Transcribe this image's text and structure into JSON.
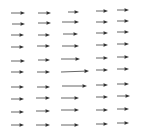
{
  "chart_data": {
    "type": "quiver",
    "title": "",
    "xlabel": "",
    "ylabel": "",
    "grid": false,
    "axes_visible": false,
    "arrow_color": "#333333",
    "columns": 5,
    "rows": 10,
    "arrows": [
      {
        "col": 1,
        "row": 1,
        "x0": 11,
        "y0": 13,
        "x1": 25,
        "y1": 13
      },
      {
        "col": 1,
        "row": 2,
        "x0": 12,
        "y0": 24,
        "x1": 25,
        "y1": 24
      },
      {
        "col": 1,
        "row": 3,
        "x0": 11,
        "y0": 35,
        "x1": 24,
        "y1": 35
      },
      {
        "col": 1,
        "row": 4,
        "x0": 11,
        "y0": 47,
        "x1": 24,
        "y1": 47
      },
      {
        "col": 1,
        "row": 5,
        "x0": 11,
        "y0": 61,
        "x1": 25,
        "y1": 61
      },
      {
        "col": 1,
        "row": 6,
        "x0": 11,
        "y0": 72,
        "x1": 24,
        "y1": 72
      },
      {
        "col": 1,
        "row": 7,
        "x0": 11,
        "y0": 87,
        "x1": 24,
        "y1": 87
      },
      {
        "col": 1,
        "row": 8,
        "x0": 11,
        "y0": 99,
        "x1": 24,
        "y1": 99
      },
      {
        "col": 1,
        "row": 9,
        "x0": 11,
        "y0": 112,
        "x1": 24,
        "y1": 112
      },
      {
        "col": 1,
        "row": 10,
        "x0": 11,
        "y0": 125,
        "x1": 24,
        "y1": 125
      },
      {
        "col": 2,
        "row": 1,
        "x0": 38,
        "y0": 13,
        "x1": 51,
        "y1": 13
      },
      {
        "col": 2,
        "row": 2,
        "x0": 38,
        "y0": 23,
        "x1": 51,
        "y1": 23
      },
      {
        "col": 2,
        "row": 3,
        "x0": 38,
        "y0": 35,
        "x1": 50,
        "y1": 35
      },
      {
        "col": 2,
        "row": 4,
        "x0": 37,
        "y0": 46,
        "x1": 50,
        "y1": 46
      },
      {
        "col": 2,
        "row": 5,
        "x0": 38,
        "y0": 60,
        "x1": 50,
        "y1": 60
      },
      {
        "col": 2,
        "row": 6,
        "x0": 37,
        "y0": 72,
        "x1": 50,
        "y1": 72
      },
      {
        "col": 2,
        "row": 7,
        "x0": 37,
        "y0": 87,
        "x1": 50,
        "y1": 87
      },
      {
        "col": 2,
        "row": 8,
        "x0": 36,
        "y0": 98,
        "x1": 50,
        "y1": 98
      },
      {
        "col": 2,
        "row": 9,
        "x0": 36,
        "y0": 111,
        "x1": 50,
        "y1": 111
      },
      {
        "col": 2,
        "row": 10,
        "x0": 36,
        "y0": 125,
        "x1": 50,
        "y1": 125
      },
      {
        "col": 3,
        "row": 1,
        "x0": 68,
        "y0": 12,
        "x1": 79,
        "y1": 12
      },
      {
        "col": 3,
        "row": 2,
        "x0": 62,
        "y0": 22,
        "x1": 79,
        "y1": 22
      },
      {
        "col": 3,
        "row": 3,
        "x0": 63,
        "y0": 34,
        "x1": 78,
        "y1": 34
      },
      {
        "col": 3,
        "row": 4,
        "x0": 62,
        "y0": 46,
        "x1": 79,
        "y1": 46
      },
      {
        "col": 3,
        "row": 5,
        "x0": 61,
        "y0": 59,
        "x1": 80,
        "y1": 59
      },
      {
        "col": 3,
        "row": 6,
        "x0": 61,
        "y0": 72,
        "x1": 89,
        "y1": 71
      },
      {
        "col": 3,
        "row": 7,
        "x0": 62,
        "y0": 86,
        "x1": 87,
        "y1": 86
      },
      {
        "col": 3,
        "row": 8,
        "x0": 61,
        "y0": 98,
        "x1": 79,
        "y1": 98
      },
      {
        "col": 3,
        "row": 9,
        "x0": 61,
        "y0": 110,
        "x1": 79,
        "y1": 110
      },
      {
        "col": 3,
        "row": 10,
        "x0": 61,
        "y0": 125,
        "x1": 79,
        "y1": 125
      },
      {
        "col": 4,
        "row": 1,
        "x0": 96,
        "y0": 11,
        "x1": 108,
        "y1": 11
      },
      {
        "col": 4,
        "row": 2,
        "x0": 96,
        "y0": 22,
        "x1": 108,
        "y1": 22
      },
      {
        "col": 4,
        "row": 3,
        "x0": 96,
        "y0": 33,
        "x1": 108,
        "y1": 33
      },
      {
        "col": 4,
        "row": 4,
        "x0": 96,
        "y0": 45,
        "x1": 108,
        "y1": 45
      },
      {
        "col": 4,
        "row": 5,
        "x0": 96,
        "y0": 58,
        "x1": 108,
        "y1": 58
      },
      {
        "col": 4,
        "row": 6,
        "x0": 96,
        "y0": 70,
        "x1": 108,
        "y1": 70
      },
      {
        "col": 4,
        "row": 7,
        "x0": 96,
        "y0": 85,
        "x1": 108,
        "y1": 85
      },
      {
        "col": 4,
        "row": 8,
        "x0": 96,
        "y0": 97,
        "x1": 108,
        "y1": 97
      },
      {
        "col": 4,
        "row": 9,
        "x0": 96,
        "y0": 110,
        "x1": 108,
        "y1": 110
      },
      {
        "col": 4,
        "row": 10,
        "x0": 96,
        "y0": 124,
        "x1": 108,
        "y1": 124
      },
      {
        "col": 5,
        "row": 1,
        "x0": 117,
        "y0": 10,
        "x1": 129,
        "y1": 10
      },
      {
        "col": 5,
        "row": 2,
        "x0": 117,
        "y0": 21,
        "x1": 129,
        "y1": 21
      },
      {
        "col": 5,
        "row": 3,
        "x0": 117,
        "y0": 32,
        "x1": 129,
        "y1": 32
      },
      {
        "col": 5,
        "row": 4,
        "x0": 117,
        "y0": 44,
        "x1": 129,
        "y1": 44
      },
      {
        "col": 5,
        "row": 5,
        "x0": 117,
        "y0": 57,
        "x1": 129,
        "y1": 57
      },
      {
        "col": 5,
        "row": 6,
        "x0": 117,
        "y0": 69,
        "x1": 129,
        "y1": 69
      },
      {
        "col": 5,
        "row": 7,
        "x0": 117,
        "y0": 84,
        "x1": 129,
        "y1": 84
      },
      {
        "col": 5,
        "row": 8,
        "x0": 117,
        "y0": 96,
        "x1": 130,
        "y1": 96
      },
      {
        "col": 5,
        "row": 9,
        "x0": 117,
        "y0": 109,
        "x1": 129,
        "y1": 109
      },
      {
        "col": 5,
        "row": 10,
        "x0": 117,
        "y0": 123,
        "x1": 129,
        "y1": 123
      }
    ]
  }
}
